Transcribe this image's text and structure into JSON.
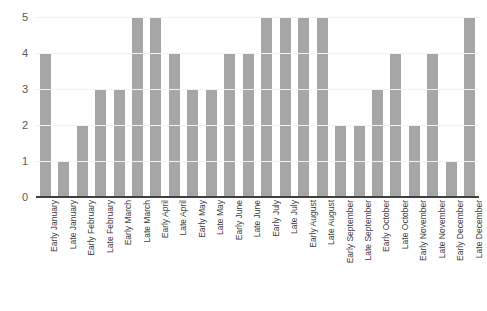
{
  "chart_data": {
    "type": "bar",
    "title": "",
    "subtitle": "",
    "xlabel": "",
    "ylabel": "",
    "ylim": [
      0,
      5
    ],
    "y_ticks": [
      0,
      1,
      2,
      3,
      4,
      5
    ],
    "grid": true,
    "legend": false,
    "bar_color": "#a6a6a6",
    "axis_color": "#404040",
    "gridline_color": "#f2f2f2",
    "background_color": "#ffffff",
    "label_color": "#404040",
    "tick_label_color": "#595959",
    "x_label_rotation": -90,
    "categories": [
      "Early January",
      "Late January",
      "Early February",
      "Late February",
      "Early March",
      "Late March",
      "Early April",
      "Late April",
      "Early May",
      "Late May",
      "Early June",
      "Late June",
      "Early July",
      "Late July",
      "Early August",
      "Late August",
      "Early September",
      "Late September",
      "Early October",
      "Late October",
      "Early November",
      "Late November",
      "Early December",
      "Late December"
    ],
    "values": [
      4,
      1,
      2,
      3,
      3,
      5,
      5,
      4,
      3,
      3,
      4,
      4,
      5,
      5,
      5,
      5,
      2,
      2,
      3,
      4,
      2,
      4,
      1,
      5
    ]
  }
}
